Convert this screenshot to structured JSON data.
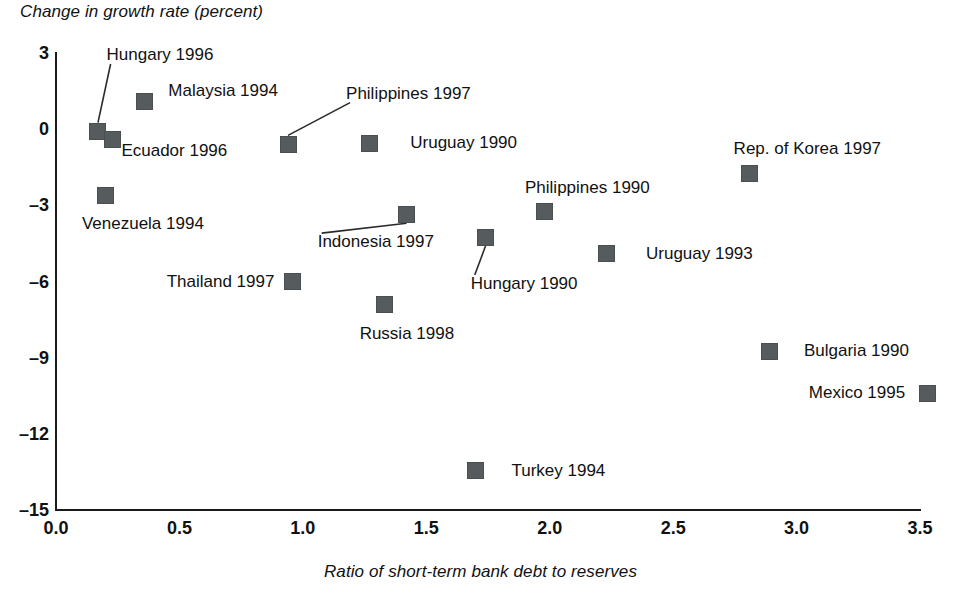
{
  "chart_data": {
    "type": "scatter",
    "title": "",
    "ylabel": "Change in growth rate (percent)",
    "xlabel": "Ratio of short-term bank debt to reserves",
    "xlim": [
      0.0,
      3.5
    ],
    "ylim": [
      -15,
      3
    ],
    "grid": false,
    "legend": "none",
    "marker_color": "#565b5d",
    "axis_color": "#1b1b1b",
    "x_ticks": [
      "0.0",
      "0.5",
      "1.0",
      "1.5",
      "2.0",
      "2.5",
      "3.0",
      "3.5"
    ],
    "y_ticks": [
      "3",
      "0",
      "–3",
      "–6",
      "–9",
      "–12",
      "–15"
    ],
    "points": [
      {
        "label": "Hungary 1996",
        "x": 0.17,
        "y": -0.1,
        "label_x": 0.205,
        "label_y": 2.92,
        "anchor": "start",
        "leader": true
      },
      {
        "label": "Malaysia 1994",
        "x": 0.36,
        "y": 1.1,
        "label_x": 0.455,
        "label_y": 1.52,
        "anchor": "start",
        "leader": false
      },
      {
        "label": "Ecuador 1996",
        "x": 0.23,
        "y": -0.4,
        "label_x": 0.265,
        "label_y": -0.85,
        "anchor": "start",
        "leader": false
      },
      {
        "label": "Venezuela 1994",
        "x": 0.2,
        "y": -2.6,
        "label_x": 0.105,
        "label_y": -3.72,
        "anchor": "start",
        "leader": false
      },
      {
        "label": "Philippines 1997",
        "x": 0.94,
        "y": -0.6,
        "label_x": 1.175,
        "label_y": 1.4,
        "anchor": "start",
        "leader": true
      },
      {
        "label": "Uruguay 1990",
        "x": 1.27,
        "y": -0.55,
        "label_x": 1.435,
        "label_y": -0.55,
        "anchor": "start",
        "leader": false
      },
      {
        "label": "Rep. of Korea 1997",
        "x": 2.81,
        "y": -1.75,
        "label_x": 2.745,
        "label_y": -0.8,
        "anchor": "start",
        "leader": false
      },
      {
        "label": "Indonesia 1997",
        "x": 1.42,
        "y": -3.35,
        "label_x": 1.06,
        "label_y": -4.45,
        "anchor": "start",
        "leader": true
      },
      {
        "label": "Philippines 1990",
        "x": 1.98,
        "y": -3.25,
        "label_x": 1.9,
        "label_y": -2.3,
        "anchor": "start",
        "leader": false
      },
      {
        "label": "Hungary 1990",
        "x": 1.74,
        "y": -4.25,
        "label_x": 1.68,
        "label_y": -6.1,
        "anchor": "start",
        "leader": true
      },
      {
        "label": "Uruguay 1993",
        "x": 2.23,
        "y": -4.9,
        "label_x": 2.39,
        "label_y": -4.9,
        "anchor": "start",
        "leader": false
      },
      {
        "label": "Thailand 1997",
        "x": 0.96,
        "y": -6.0,
        "label_x": 0.885,
        "label_y": -6.0,
        "anchor": "end",
        "leader": false
      },
      {
        "label": "Russia 1998",
        "x": 1.33,
        "y": -6.9,
        "label_x": 1.23,
        "label_y": -8.05,
        "anchor": "start",
        "leader": false
      },
      {
        "label": "Bulgaria 1990",
        "x": 2.89,
        "y": -8.75,
        "label_x": 3.03,
        "label_y": -8.75,
        "anchor": "start",
        "leader": false
      },
      {
        "label": "Mexico 1995",
        "x": 3.53,
        "y": -10.4,
        "label_x": 3.44,
        "label_y": -10.4,
        "anchor": "end",
        "leader": false
      },
      {
        "label": "Turkey 1994",
        "x": 1.7,
        "y": -13.45,
        "label_x": 1.845,
        "label_y": -13.45,
        "anchor": "start",
        "leader": false
      }
    ]
  }
}
